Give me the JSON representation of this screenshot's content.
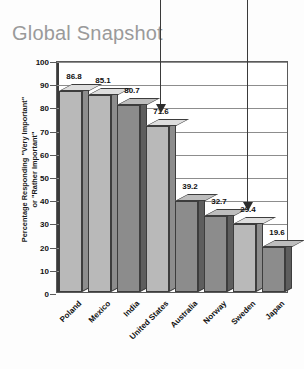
{
  "title": "Global Snapshot",
  "chart_data": {
    "type": "bar",
    "title": "Global Snapshot",
    "xlabel": "",
    "ylabel": "Percentage Responding \"Very Important\"\nor \"Rather Important\"",
    "ylim": [
      0,
      100
    ],
    "yticks": [
      "100",
      "90",
      "80",
      "70",
      "60",
      "50",
      "40",
      "30",
      "20",
      "10",
      "0"
    ],
    "grid": true,
    "legend": "none",
    "categories": [
      "Poland",
      "Mexico",
      "India",
      "United States",
      "Australia",
      "Norway",
      "Sweden",
      "Japan"
    ],
    "values": [
      86.8,
      85.1,
      80.7,
      71.6,
      39.2,
      32.7,
      29.4,
      19.6
    ],
    "value_labels": [
      "86.8",
      "85.1",
      "80.7",
      "71.6",
      "39.2",
      "32.7",
      "29.4",
      "19.6"
    ],
    "bar_shades": [
      "light",
      "light",
      "dark",
      "light",
      "dark",
      "dark",
      "light",
      "dark"
    ],
    "annotations": [
      {
        "name": "arrow-united-states",
        "target": "United States",
        "type": "down-arrow"
      },
      {
        "name": "arrow-sweden",
        "target": "Sweden",
        "type": "down-arrow"
      }
    ],
    "colors": {
      "bar_light_face": "#b9b9b9",
      "bar_light_top": "#dedede",
      "bar_light_side": "#8d8d8d",
      "bar_dark_face": "#8c8c8c",
      "bar_dark_top": "#bdbdbd",
      "bar_dark_side": "#5e5e5e",
      "title": "#9a9a9a",
      "axis": "#3a3a3a",
      "grid": "#8d8d8d"
    }
  }
}
